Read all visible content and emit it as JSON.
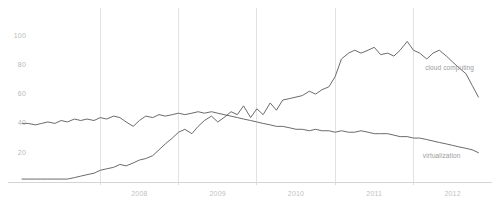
{
  "chart_data": {
    "type": "line",
    "title": "",
    "subtitle": "",
    "xlabel": "",
    "ylabel": "",
    "xlim": [
      2007.0,
      2012.85
    ],
    "ylim": [
      0,
      112
    ],
    "grid": true,
    "grid_axis": "x",
    "legend_position": "inline-right",
    "y_ticks": [
      20,
      40,
      60,
      80,
      100
    ],
    "y_tick_labels": [
      "20",
      "40",
      "60",
      "80",
      "100"
    ],
    "x_ticks": [
      2008,
      2009,
      2010,
      2011,
      2012
    ],
    "x_tick_labels": [
      "2008",
      "2009",
      "2010",
      "2011",
      "2012"
    ],
    "gridline_years": [
      2008,
      2009,
      2010,
      2011,
      2012
    ],
    "series": [
      {
        "name": "cloud computing",
        "color": "#6b6b6b",
        "label_x": 2012.15,
        "label_y": 78,
        "x": [
          2007.0,
          2007.08,
          2007.17,
          2007.25,
          2007.33,
          2007.42,
          2007.5,
          2007.58,
          2007.67,
          2007.75,
          2007.83,
          2007.92,
          2008.0,
          2008.08,
          2008.17,
          2008.25,
          2008.33,
          2008.42,
          2008.5,
          2008.58,
          2008.67,
          2008.75,
          2008.83,
          2008.92,
          2009.0,
          2009.08,
          2009.17,
          2009.25,
          2009.33,
          2009.42,
          2009.5,
          2009.58,
          2009.67,
          2009.75,
          2009.83,
          2009.92,
          2010.0,
          2010.08,
          2010.17,
          2010.25,
          2010.33,
          2010.42,
          2010.5,
          2010.58,
          2010.67,
          2010.75,
          2010.83,
          2010.92,
          2011.0,
          2011.08,
          2011.17,
          2011.25,
          2011.33,
          2011.42,
          2011.5,
          2011.58,
          2011.67,
          2011.75,
          2011.83,
          2011.92,
          2012.0,
          2012.08,
          2012.17,
          2012.25,
          2012.33,
          2012.42,
          2012.5,
          2012.58,
          2012.67,
          2012.75,
          2012.83
        ],
        "y": [
          2,
          2,
          2,
          2,
          2,
          2,
          2,
          2,
          3,
          4,
          5,
          6,
          8,
          9,
          10,
          12,
          11,
          13,
          15,
          16,
          18,
          22,
          26,
          30,
          34,
          36,
          33,
          38,
          42,
          45,
          41,
          44,
          48,
          46,
          52,
          44,
          50,
          46,
          54,
          49,
          56,
          57,
          58,
          59,
          62,
          60,
          63,
          65,
          72,
          84,
          88,
          90,
          88,
          90,
          92,
          87,
          88,
          86,
          90,
          96,
          90,
          88,
          84,
          88,
          90,
          86,
          82,
          78,
          74,
          66,
          58
        ]
      },
      {
        "name": "virtualization",
        "color": "#6b6b6b",
        "label_x": 2012.12,
        "label_y": 18,
        "x": [
          2007.0,
          2007.08,
          2007.17,
          2007.25,
          2007.33,
          2007.42,
          2007.5,
          2007.58,
          2007.67,
          2007.75,
          2007.83,
          2007.92,
          2008.0,
          2008.08,
          2008.17,
          2008.25,
          2008.33,
          2008.42,
          2008.5,
          2008.58,
          2008.67,
          2008.75,
          2008.83,
          2008.92,
          2009.0,
          2009.08,
          2009.17,
          2009.25,
          2009.33,
          2009.42,
          2009.5,
          2009.58,
          2009.67,
          2009.75,
          2009.83,
          2009.92,
          2010.0,
          2010.08,
          2010.17,
          2010.25,
          2010.33,
          2010.42,
          2010.5,
          2010.58,
          2010.67,
          2010.75,
          2010.83,
          2010.92,
          2011.0,
          2011.08,
          2011.17,
          2011.25,
          2011.33,
          2011.42,
          2011.5,
          2011.58,
          2011.67,
          2011.75,
          2011.83,
          2011.92,
          2012.0,
          2012.08,
          2012.17,
          2012.25,
          2012.33,
          2012.42,
          2012.5,
          2012.58,
          2012.67,
          2012.75,
          2012.83
        ],
        "y": [
          40,
          40,
          39,
          40,
          41,
          40,
          42,
          41,
          43,
          42,
          43,
          42,
          44,
          43,
          45,
          44,
          41,
          38,
          42,
          45,
          44,
          46,
          45,
          46,
          47,
          46,
          47,
          48,
          47,
          48,
          47,
          46,
          45,
          44,
          43,
          42,
          41,
          40,
          39,
          38,
          38,
          37,
          36,
          36,
          35,
          36,
          35,
          35,
          34,
          35,
          34,
          34,
          35,
          34,
          33,
          33,
          33,
          32,
          31,
          31,
          30,
          30,
          29,
          28,
          27,
          26,
          25,
          24,
          23,
          22,
          20
        ]
      }
    ]
  },
  "labels": {
    "series_cloud": "cloud computing",
    "series_virtualization": "virtualization"
  }
}
